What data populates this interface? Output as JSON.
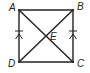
{
  "diagram": {
    "type": "geometry",
    "shape": "quadrilateral ABCD with diagonals AC and BD intersecting at E",
    "colors": {
      "stroke": "#231f20",
      "background": "#ffffff"
    },
    "points": {
      "A": {
        "label": "A",
        "x": 19,
        "y": 10
      },
      "B": {
        "label": "B",
        "x": 73,
        "y": 10
      },
      "C": {
        "label": "C",
        "x": 73,
        "y": 62
      },
      "D": {
        "label": "D",
        "x": 19,
        "y": 62
      },
      "E": {
        "label": "E",
        "x": 46,
        "y": 36
      }
    },
    "segments": [
      "AB",
      "BC",
      "CD",
      "DA",
      "AC",
      "BD"
    ],
    "markings": [
      {
        "segment": "AD",
        "type": "parallel-arrow",
        "count": 1
      },
      {
        "segment": "AD",
        "type": "congruence-tick",
        "count": 1
      },
      {
        "segment": "BC",
        "type": "parallel-arrow",
        "count": 1
      },
      {
        "segment": "BC",
        "type": "congruence-tick",
        "count": 1
      }
    ]
  }
}
